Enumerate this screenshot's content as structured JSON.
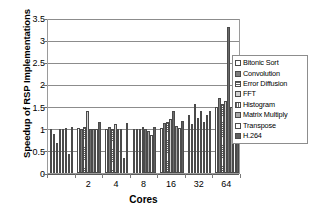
{
  "chart_data": {
    "type": "bar",
    "title": "",
    "xlabel": "Cores",
    "ylabel": "Speedup of RSP Implementations",
    "categories": [
      "1",
      "2",
      "4",
      "8",
      "16",
      "32",
      "64"
    ],
    "tick_labels": [
      "2",
      "4",
      "8",
      "16",
      "32",
      "64"
    ],
    "ylim": [
      0,
      3.5
    ],
    "yticks": [
      0,
      0.5,
      1,
      1.5,
      2,
      2.5,
      3,
      3.5
    ],
    "ytick_labels": [
      "0",
      "0.5",
      "1",
      "1.5",
      "2",
      "2.5",
      "3",
      "3.5"
    ],
    "grid": true,
    "legend_position": "right",
    "baseline": 1,
    "series": [
      {
        "name": "Bitonic Sort",
        "swatch": "p-white",
        "values": [
          1.0,
          1.02,
          1.0,
          1.0,
          1.02,
          1.3,
          1.5
        ]
      },
      {
        "name": "Convolution",
        "swatch": "p-dkgray",
        "values": [
          0.87,
          1.0,
          1.04,
          1.0,
          1.13,
          1.1,
          1.7
        ]
      },
      {
        "name": "Error Diffusion",
        "swatch": "p-hlines",
        "values": [
          0.68,
          1.05,
          1.0,
          1.0,
          1.15,
          1.55,
          1.56
        ]
      },
      {
        "name": "FFT",
        "swatch": "p-ltgray",
        "values": [
          1.0,
          1.4,
          1.1,
          1.05,
          1.22,
          1.25,
          1.62
        ]
      },
      {
        "name": "Histogram",
        "swatch": "p-vlines",
        "values": [
          1.0,
          1.0,
          1.0,
          1.0,
          1.4,
          1.4,
          3.3
        ]
      },
      {
        "name": "Matrix Multiply",
        "swatch": "p-mdgray",
        "values": [
          1.02,
          1.0,
          1.0,
          0.96,
          1.07,
          1.15,
          1.48
        ]
      },
      {
        "name": "Transpose",
        "swatch": "p-white2",
        "values": [
          0.42,
          1.0,
          0.33,
          0.85,
          1.02,
          1.3,
          1.44
        ]
      },
      {
        "name": "H.264",
        "swatch": "p-vdkgray",
        "values": [
          1.05,
          1.15,
          1.12,
          1.05,
          1.18,
          1.4,
          1.95
        ]
      }
    ]
  }
}
